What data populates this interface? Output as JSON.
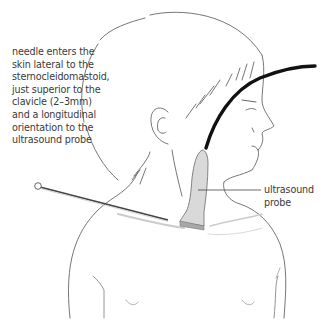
{
  "figure": {
    "labels": {
      "needle": {
        "lines": [
          "needle enters the",
          "skin lateral to the",
          "sternocleidomastoid,",
          "just superior to the",
          "clavicle (2–3mm)",
          "and a longitudinal",
          "orientation to the",
          "ultrasound probe"
        ]
      },
      "probe": {
        "lines": [
          "ultrasound",
          "probe"
        ]
      }
    },
    "colors": {
      "outline": "#555555",
      "cable": "#111111",
      "probe_fill": "#d9d9d9",
      "probe_base": "#a8a8a8",
      "needle": "#444444",
      "text": "#3a3a3a"
    }
  }
}
